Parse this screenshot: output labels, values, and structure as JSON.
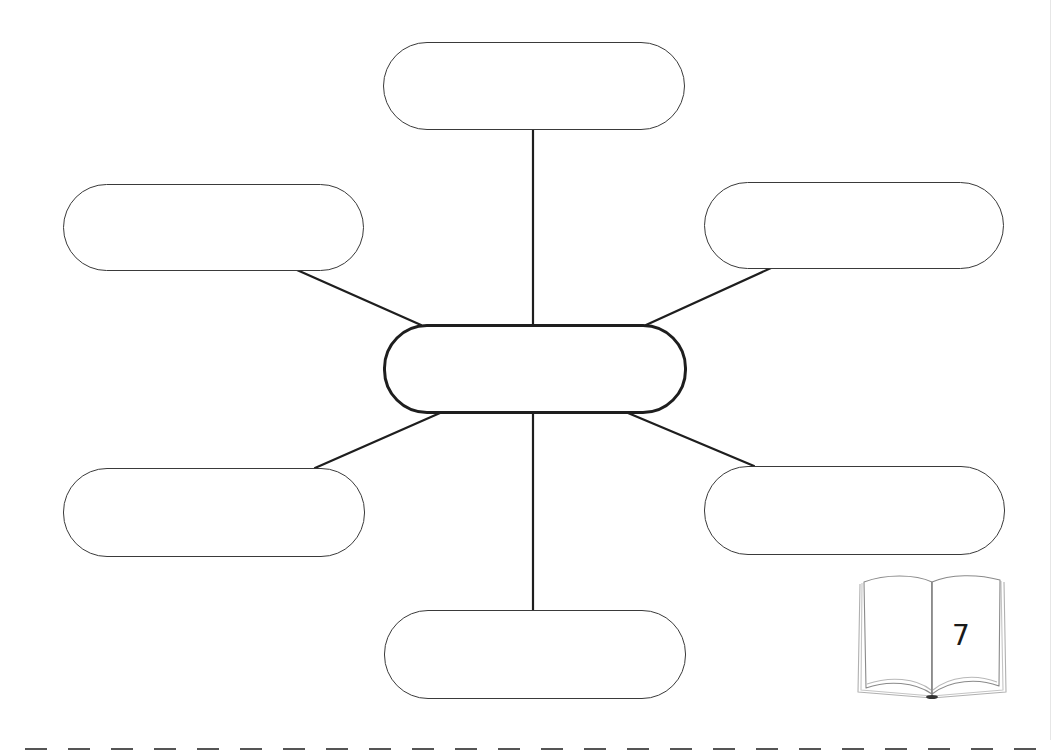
{
  "diagram": {
    "type": "spider-map",
    "center_node": {
      "label": ""
    },
    "branch_nodes": [
      {
        "position": "top",
        "label": ""
      },
      {
        "position": "top-left",
        "label": ""
      },
      {
        "position": "top-right",
        "label": ""
      },
      {
        "position": "bottom-left",
        "label": ""
      },
      {
        "position": "bottom-right",
        "label": ""
      },
      {
        "position": "bottom",
        "label": ""
      }
    ]
  },
  "page": {
    "icon": "open-book-icon",
    "number": "7"
  },
  "footer": {
    "cut_line": "dashed-line"
  },
  "colors": {
    "outline": "#3a3a3a",
    "center_outline": "#1e1e1e",
    "connector": "#1e1e1e",
    "background": "#ffffff"
  }
}
